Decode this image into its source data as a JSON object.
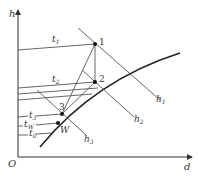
{
  "diagram": {
    "type": "h-d psychrometric chart process diagram",
    "axes": {
      "y_label": "h",
      "x_label": "d",
      "origin_label": "O"
    },
    "points": [
      {
        "id": "1",
        "label": "1"
      },
      {
        "id": "2",
        "label": "2"
      },
      {
        "id": "3",
        "label": "3"
      },
      {
        "id": "W",
        "label": "W"
      }
    ],
    "isotherm_labels": {
      "t1": "t",
      "t1_sub": "1",
      "t2": "t",
      "t2_sub": "2",
      "t3": "t",
      "t3_sub": "3",
      "tw": "t",
      "tw_sub": "W",
      "t0": "t",
      "t0_sub": "0"
    },
    "enthalpy_labels": {
      "h1": "h",
      "h1_sub": "1",
      "h2": "h",
      "h2_sub": "2",
      "h3": "h",
      "h3_sub": "3"
    },
    "colors": {
      "line": "#555555",
      "curve": "#222222",
      "point": "#111111"
    }
  }
}
